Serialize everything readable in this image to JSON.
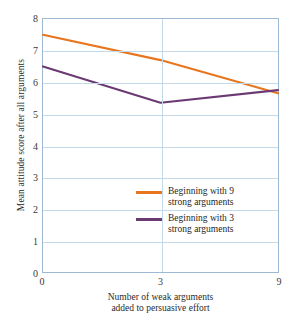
{
  "chart_data": {
    "type": "line",
    "title": "",
    "xlabel": "Number of weak arguments added to persuasive effort",
    "xlabel_line1": "Number of weak arguments",
    "xlabel_line2": "added to persuasive effort",
    "ylabel": "Mean attitude score after all arguments",
    "x": [
      0,
      3,
      9
    ],
    "xticklabels": [
      "0",
      "3",
      "9"
    ],
    "yticklabels": [
      "0",
      "1",
      "2",
      "3",
      "4",
      "5",
      "6",
      "7",
      "8"
    ],
    "ylim": [
      0,
      8
    ],
    "grid": "horizontal-and-vertical",
    "legend_position": "inside-center-right",
    "series": [
      {
        "name": "Beginning with 9 strong arguments",
        "label_line1": "Beginning with 9",
        "label_line2": "strong arguments",
        "color": "#e8761e",
        "values": [
          7.5,
          6.7,
          5.65
        ]
      },
      {
        "name": "Beginning with 3 strong arguments",
        "label_line1": "Beginning with 3",
        "label_line2": "strong arguments",
        "color": "#6b3a73",
        "values": [
          6.5,
          5.35,
          5.75
        ]
      }
    ]
  },
  "colors": {
    "gridline": "#c3d9ec",
    "frame": "#9db9d4",
    "background": "#ffffff",
    "text": "#2b2b2b"
  }
}
